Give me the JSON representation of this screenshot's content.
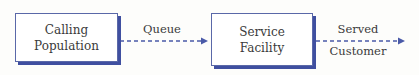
{
  "diagram": {
    "type": "flow",
    "nodes": [
      {
        "id": "calling-population",
        "line1": "Calling",
        "line2": "Population"
      },
      {
        "id": "service-facility",
        "line1": "Service",
        "line2": "Facility"
      }
    ],
    "edges": [
      {
        "from": "calling-population",
        "to": "service-facility",
        "label": "Queue",
        "style": "dashed"
      },
      {
        "from": "service-facility",
        "to": "exit",
        "label_line1": "Served",
        "label_line2": "Customer",
        "style": "dashed"
      }
    ],
    "colors": {
      "box_border": "#5a68a8",
      "box_shadow": "#3f4fa0",
      "arrow": "#4a5aa8",
      "text": "#3a3a3a"
    }
  }
}
